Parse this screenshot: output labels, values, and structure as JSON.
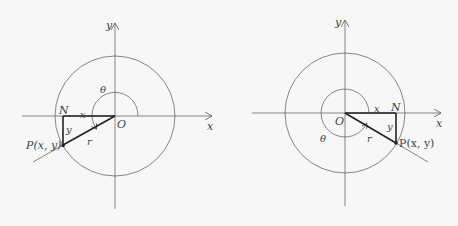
{
  "diagrams": [
    {
      "id": "left",
      "description": "Angle theta in third quadrant, P below negative x-axis",
      "labels": {
        "y_axis": "y",
        "x_axis": "x",
        "theta": "θ",
        "origin": "O",
        "foot": "N",
        "adjacent": "x",
        "opposite": "y",
        "radius": "r",
        "point": "P(x, y)"
      }
    },
    {
      "id": "right",
      "description": "Angle theta in fourth quadrant (reflex), P below positive x-axis",
      "labels": {
        "y_axis": "y",
        "x_axis": "x",
        "theta": "θ",
        "origin": "O",
        "foot": "N",
        "adjacent": "x",
        "opposite": "y",
        "radius": "r",
        "point": "P(x, y)"
      }
    }
  ],
  "colors": {
    "background": "#f7f7f7",
    "line": "#555555",
    "thick_line": "#222222",
    "text": "#444444"
  }
}
